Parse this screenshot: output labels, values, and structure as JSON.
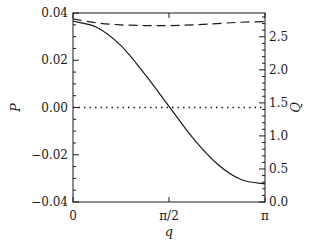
{
  "chart_data": {
    "type": "line",
    "title": "",
    "xlabel": "q",
    "ylabel_left": "P",
    "ylabel_right": "Q",
    "xlim": [
      0,
      3.14159265
    ],
    "ylim_left": [
      -0.04,
      0.04
    ],
    "ylim_right": [
      0.0,
      2.86
    ],
    "x_ticks": [
      {
        "value": 0,
        "label": "0"
      },
      {
        "value": 1.5707963,
        "label": "π/2"
      },
      {
        "value": 3.14159265,
        "label": "π"
      }
    ],
    "y_left_ticks": [
      {
        "value": 0.04,
        "label": "0.04"
      },
      {
        "value": 0.02,
        "label": "0.02"
      },
      {
        "value": 0.0,
        "label": "0.00"
      },
      {
        "value": -0.02,
        "label": "−0.02"
      },
      {
        "value": -0.04,
        "label": "−0.04"
      }
    ],
    "y_right_ticks": [
      {
        "value": 2.5,
        "label": "2.5"
      },
      {
        "value": 2.0,
        "label": "2.0"
      },
      {
        "value": 1.5,
        "label": "1.5"
      },
      {
        "value": 1.0,
        "label": "1.0"
      },
      {
        "value": 0.5,
        "label": "0.5"
      },
      {
        "value": 0.0,
        "label": "0.0"
      }
    ],
    "y_left_minor_step": 0.005,
    "y_right_minor_step": 0.1,
    "grid": false,
    "legend": "none",
    "series": [
      {
        "name": "P",
        "axis": "left",
        "style": "solid",
        "color": "#1a1a1a",
        "x": [
          0,
          0.3927,
          0.7854,
          1.1781,
          1.5708,
          1.9635,
          2.3562,
          2.7489,
          3.1416
        ],
        "values": [
          0.0365,
          0.0339,
          0.0262,
          0.014,
          0.0005,
          -0.013,
          -0.0238,
          -0.0305,
          -0.0323
        ]
      },
      {
        "name": "Q",
        "axis": "right",
        "style": "dashed",
        "color": "#1a1a1a",
        "x": [
          0,
          0.3927,
          0.7854,
          1.1781,
          1.5708,
          1.9635,
          2.3562,
          2.7489,
          3.1416
        ],
        "values": [
          2.77,
          2.71,
          2.68,
          2.67,
          2.67,
          2.68,
          2.7,
          2.72,
          2.73
        ]
      },
      {
        "name": "zero-reference",
        "axis": "left",
        "style": "dotted",
        "color": "#1a1a1a",
        "x": [
          0,
          3.1416
        ],
        "values": [
          0,
          0
        ]
      }
    ]
  }
}
